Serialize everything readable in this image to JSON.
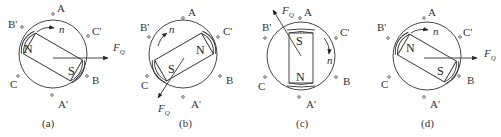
{
  "figure": {
    "panels": [
      {
        "id": "a",
        "caption": "(a)",
        "center": [
          53,
          54
        ],
        "rotor_angle_deg": 30,
        "north_label": "N",
        "south_label": "S",
        "speed_label": "n",
        "force_label": "F",
        "force_subscript": "Q",
        "stator_labels": {
          "A": "A",
          "A_prime": "A'",
          "B": "B",
          "B_prime": "B'",
          "C": "C",
          "C_prime": "C'"
        }
      },
      {
        "id": "b",
        "caption": "(b)",
        "center": [
          180,
          54
        ],
        "rotor_angle_deg": -30,
        "north_label": "N",
        "south_label": "S",
        "speed_label": "n",
        "force_label": "F",
        "force_subscript": "Q",
        "stator_labels": {
          "A": "A",
          "A_prime": "A'",
          "B": "B",
          "B_prime": "B'",
          "C": "C",
          "C_prime": "C'"
        }
      },
      {
        "id": "c",
        "caption": "(c)",
        "center": [
          300,
          54
        ],
        "rotor_angle_deg": 90,
        "north_label": "N",
        "south_label": "S",
        "speed_label": "n",
        "force_label": "F",
        "force_subscript": "Q",
        "stator_labels": {
          "A": "A",
          "A_prime": "A'",
          "B": "B",
          "B_prime": "B'",
          "C": "C",
          "C_prime": "C'"
        }
      },
      {
        "id": "d",
        "caption": "(d)",
        "center": [
          430,
          54
        ],
        "rotor_angle_deg": 30,
        "north_label": "N",
        "south_label": "S",
        "speed_label": "n",
        "force_label": "F",
        "force_subscript": "Q",
        "stator_labels": {
          "A": "A",
          "A_prime": "A'",
          "B": "B",
          "B_prime": "B'",
          "C": "C",
          "C_prime": "C'"
        }
      }
    ],
    "colors": {
      "line": "#333333",
      "background": "#ffffff"
    }
  }
}
